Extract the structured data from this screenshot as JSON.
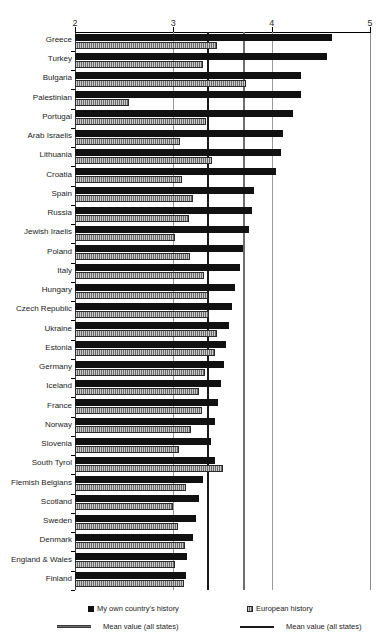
{
  "chart_data": {
    "type": "bar",
    "orientation": "horizontal",
    "title": "",
    "xlabel": "",
    "ylabel": "",
    "xlim": [
      2,
      5
    ],
    "xticks": [
      2,
      3,
      4,
      5
    ],
    "xtick_labels": [
      "2",
      "3",
      "4",
      "5"
    ],
    "grid": true,
    "grid_axis": "x",
    "legend_position": "bottom",
    "categories": [
      "Greece",
      "Turkey",
      "Bulgaria",
      "Palestinian",
      "Portugal",
      "Arab Israelis",
      "Lithuania",
      "Croatia",
      "Spain",
      "Russia",
      "Jewish Iraelis",
      "Poland",
      "Italy",
      "Hungary",
      "Czech Republic",
      "Ukraine",
      "Estonia",
      "Germany",
      "Iceland",
      "France",
      "Norway",
      "Slovenia",
      "South Tyrol",
      "Flemish Belgians",
      "Scotland",
      "Sweden",
      "Denmark",
      "England & Wales",
      "Finland"
    ],
    "series": [
      {
        "name": "My own country's history",
        "color": "#111111",
        "values": [
          4.61,
          4.56,
          4.3,
          4.3,
          4.22,
          4.12,
          4.09,
          4.04,
          3.82,
          3.8,
          3.77,
          3.71,
          3.68,
          3.63,
          3.6,
          3.57,
          3.54,
          3.52,
          3.48,
          3.45,
          3.42,
          3.38,
          3.42,
          3.3,
          3.26,
          3.23,
          3.2,
          3.14,
          3.13
        ]
      },
      {
        "name": "European history",
        "color": "#9a9a9a",
        "values": [
          3.44,
          3.3,
          3.74,
          2.55,
          3.33,
          3.07,
          3.39,
          3.09,
          3.2,
          3.16,
          3.02,
          3.17,
          3.31,
          3.35,
          3.36,
          3.44,
          3.42,
          3.32,
          3.26,
          3.29,
          3.18,
          3.06,
          3.5,
          3.13,
          3.0,
          3.05,
          3.12,
          3.02,
          3.11
        ]
      }
    ],
    "mean_lines": [
      {
        "name": "Mean value (all states) — My own country's history",
        "value": 3.34,
        "color": "#1a1a1a",
        "series": "own"
      },
      {
        "name": "Mean value (all states) — European history",
        "value": 3.71,
        "color": "#6e6e6e",
        "series": "euro"
      }
    ]
  },
  "legend": {
    "own_label": "My own country's history",
    "euro_label": "European history",
    "mean_own_label": "Mean value (all states)",
    "mean_euro_label": "Mean value (all states)"
  }
}
